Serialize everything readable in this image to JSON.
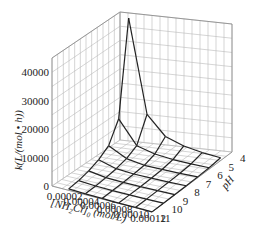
{
  "chart_data": {
    "type": "surface3d",
    "title": "",
    "zlabel": "k(L/(mol • h))",
    "xlabel": "[NH2Cl]0 (mol/L)",
    "ylabel": "pH",
    "x_ticks": [
      "0.00002",
      "0.00004",
      "0.00006",
      "0.00008",
      "0.00010",
      "0.00012"
    ],
    "y_ticks": [
      "4",
      "5",
      "6",
      "7",
      "8",
      "9",
      "10",
      "11"
    ],
    "z_ticks": [
      "0",
      "10000",
      "20000",
      "30000",
      "40000"
    ],
    "zlim": [
      0,
      45000
    ],
    "x": [
      2e-05,
      4e-05,
      6e-05,
      8e-05,
      0.0001,
      0.00012
    ],
    "y": [
      5,
      6,
      7,
      8,
      9,
      10,
      11
    ],
    "z": [
      [
        46000,
        13000,
        6000,
        3500,
        2000,
        1000,
        500
      ],
      [
        13000,
        4500,
        2500,
        1500,
        900,
        500,
        300
      ],
      [
        6000,
        2500,
        1200,
        800,
        500,
        300,
        200
      ],
      [
        3500,
        1500,
        800,
        500,
        300,
        200,
        100
      ],
      [
        2000,
        900,
        500,
        300,
        200,
        100,
        80
      ],
      [
        1000,
        500,
        300,
        200,
        100,
        80,
        50
      ]
    ]
  },
  "labels": {
    "z_axis": "k(L/(mol • h))",
    "x_axis_prefix": "[NH",
    "x_axis_sub2": "2",
    "x_axis_mid": "Cl]",
    "x_axis_sub0": "0",
    "x_axis_suffix": " (mol/L)",
    "y_axis": "pH"
  }
}
